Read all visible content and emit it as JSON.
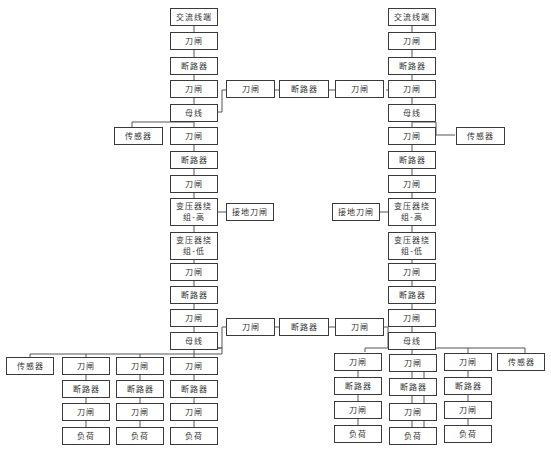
{
  "diagram": {
    "title": "",
    "colors": {
      "border": "#3a3a3a",
      "line": "#555555",
      "text": "#333333",
      "background": "#ffffff"
    },
    "left_main_chain": [
      "交流线端",
      "刀闸",
      "断路器",
      "刀闸",
      "母线",
      "刀闸",
      "断路器",
      "刀闸",
      "变压器绕\n组-高",
      "变压器绕\n组-低",
      "刀闸",
      "断路器",
      "刀闸",
      "母线"
    ],
    "right_main_chain": [
      "交流线端",
      "刀闸",
      "断路器",
      "刀闸",
      "母线",
      "刀闸",
      "断路器",
      "刀闸",
      "变压器绕\n组-高",
      "变压器绕\n组-低",
      "刀闸",
      "断路器",
      "刀闸",
      "母线"
    ],
    "upper_tie": [
      "刀闸",
      "断路器",
      "刀闸"
    ],
    "lower_tie": [
      "刀闸",
      "断路器",
      "刀闸"
    ],
    "left_upper_sensor": "传感器",
    "right_upper_sensor": "传感器",
    "left_ground_switch": "接地刀闸",
    "right_ground_switch": "接地刀闸",
    "left_bottom_sensor": "传感器",
    "right_bottom_sensor": "传感器",
    "left_feeders": [
      [
        "刀闸",
        "断路器",
        "刀闸",
        "负荷"
      ],
      [
        "刀闸",
        "断路器",
        "刀闸",
        "负荷"
      ],
      [
        "刀闸",
        "断路器",
        "刀闸",
        "负荷"
      ]
    ],
    "right_feeders": [
      [
        "刀闸",
        "断路器",
        "刀闸",
        "负荷"
      ],
      [
        "刀闸",
        "断路器",
        "刀闸",
        "负荷"
      ],
      [
        "刀闸",
        "断路器",
        "刀闸",
        "负荷"
      ]
    ]
  }
}
